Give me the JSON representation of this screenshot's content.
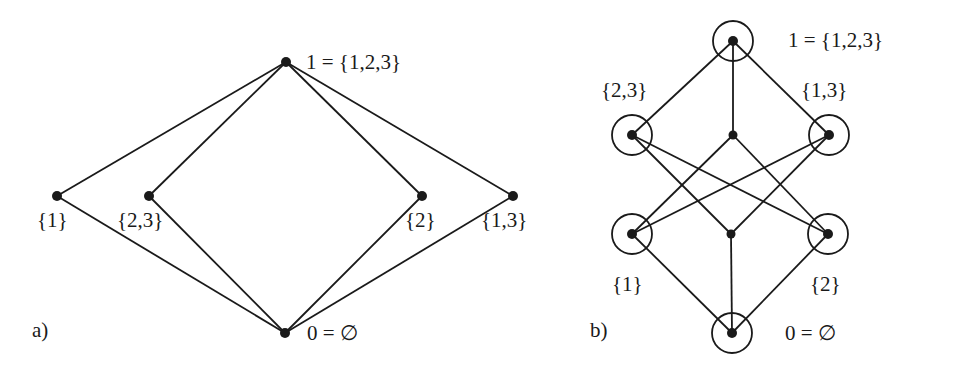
{
  "diagram_a": {
    "panel_label": "a)",
    "nodes": [
      {
        "id": "top",
        "label": "1 = {1,2,3}",
        "x": 286,
        "y": 62,
        "circled": false,
        "lx": 306,
        "ly": 52
      },
      {
        "id": "s1",
        "label": "{1}",
        "x": 57,
        "y": 196,
        "circled": false,
        "lx": 37,
        "ly": 210
      },
      {
        "id": "s23",
        "label": "{2,3}",
        "x": 149,
        "y": 196,
        "circled": false,
        "lx": 117,
        "ly": 210
      },
      {
        "id": "s2",
        "label": "{2}",
        "x": 422,
        "y": 196,
        "circled": false,
        "lx": 405,
        "ly": 210
      },
      {
        "id": "s13",
        "label": "{1,3}",
        "x": 513,
        "y": 196,
        "circled": false,
        "lx": 481,
        "ly": 210
      },
      {
        "id": "bottom",
        "label": "0 = ∅",
        "x": 285,
        "y": 333,
        "circled": false,
        "lx": 307,
        "ly": 323
      }
    ],
    "edges": [
      [
        "top",
        "s1"
      ],
      [
        "top",
        "s23"
      ],
      [
        "top",
        "s2"
      ],
      [
        "top",
        "s13"
      ],
      [
        "bottom",
        "s1"
      ],
      [
        "bottom",
        "s23"
      ],
      [
        "bottom",
        "s2"
      ],
      [
        "bottom",
        "s13"
      ]
    ]
  },
  "diagram_b": {
    "panel_label": "b)",
    "nodes": [
      {
        "id": "top",
        "label": "1 = {1,2,3}",
        "x": 733,
        "y": 41,
        "circled": true,
        "lx": 788,
        "ly": 30
      },
      {
        "id": "s23",
        "label": "{2,3}",
        "x": 632,
        "y": 135,
        "circled": true,
        "lx": 601,
        "ly": 80
      },
      {
        "id": "mid_top",
        "label": "",
        "x": 733,
        "y": 135,
        "circled": false
      },
      {
        "id": "s13",
        "label": "{1,3}",
        "x": 829,
        "y": 135,
        "circled": true,
        "lx": 801,
        "ly": 80
      },
      {
        "id": "s1",
        "label": "{1}",
        "x": 632,
        "y": 234,
        "circled": true,
        "lx": 612,
        "ly": 274
      },
      {
        "id": "mid_bottom",
        "label": "",
        "x": 731,
        "y": 234,
        "circled": false
      },
      {
        "id": "s2",
        "label": "{2}",
        "x": 828,
        "y": 234,
        "circled": true,
        "lx": 810,
        "ly": 274
      },
      {
        "id": "bottom",
        "label": "0 = ∅",
        "x": 732,
        "y": 333,
        "circled": true,
        "lx": 785,
        "ly": 323
      }
    ],
    "edges": [
      [
        "top",
        "s23"
      ],
      [
        "top",
        "mid_top"
      ],
      [
        "top",
        "s13"
      ],
      [
        "s23",
        "s2"
      ],
      [
        "s23",
        "mid_bottom"
      ],
      [
        "mid_top",
        "s1"
      ],
      [
        "mid_top",
        "s2"
      ],
      [
        "s13",
        "s1"
      ],
      [
        "s13",
        "mid_bottom"
      ],
      [
        "s1",
        "bottom"
      ],
      [
        "mid_bottom",
        "bottom"
      ],
      [
        "s2",
        "bottom"
      ]
    ]
  },
  "panel_labels": {
    "a": {
      "text": "a)",
      "x": 32,
      "y": 320
    },
    "b": {
      "text": "b)",
      "x": 590,
      "y": 320
    }
  },
  "style": {
    "stroke": "#1a1a1a",
    "background": "#ffffff"
  }
}
